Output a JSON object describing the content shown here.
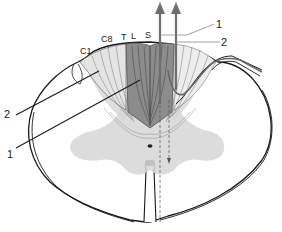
{
  "diagram": {
    "segment_labels": [
      "C1",
      "C8",
      "T",
      "L",
      "S"
    ],
    "callouts": [
      {
        "id": "right-1",
        "text": "1"
      },
      {
        "id": "right-2",
        "text": "2"
      },
      {
        "id": "left-2",
        "text": "2"
      },
      {
        "id": "left-1",
        "text": "1"
      }
    ],
    "colors": {
      "outline": "#1a1a1a",
      "gray_matter": "#d6d6d6",
      "fasciculus_gracilis": "#8c8c8c",
      "fasciculus_cuneatus": "#e4e4e4",
      "arrow": "#6e6e6e",
      "background": "#ffffff"
    }
  }
}
